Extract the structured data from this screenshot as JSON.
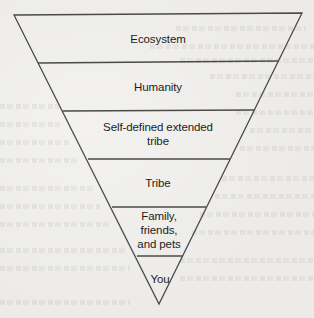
{
  "diagram": {
    "type": "inverted-pyramid",
    "levels": [
      {
        "label": "Ecosystem"
      },
      {
        "label": "Humanity"
      },
      {
        "label": "Self-defined extended\ntribe"
      },
      {
        "label": "Tribe"
      },
      {
        "label": "Family,\nfriends,\nand pets"
      },
      {
        "label": "You"
      }
    ]
  },
  "colors": {
    "background": "#ecebe8",
    "stroke": "#4a4a4a",
    "text": "#1c1c1c"
  }
}
